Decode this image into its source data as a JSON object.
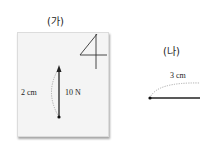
{
  "figures": [
    {
      "id": "ga",
      "heading": "(가)",
      "corner_glyph": "4",
      "distance_label": "2 cm",
      "force_label": "10 N",
      "force_direction": "up"
    },
    {
      "id": "na",
      "heading": "(나)",
      "distance_label": "3 cm"
    }
  ],
  "colors": {
    "panel_bg": "#f4f4f4",
    "line": "#222222",
    "dotted_arc": "#999999"
  }
}
